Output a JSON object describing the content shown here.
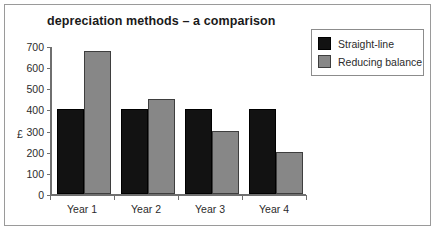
{
  "chart_data": {
    "type": "bar",
    "title": "depreciation methods – a comparison",
    "xlabel": "",
    "ylabel": "£",
    "categories": [
      "Year  1",
      "Year  2",
      "Year  3",
      "Year  4"
    ],
    "series": [
      {
        "name": "Straight-line",
        "color": "#121212",
        "values": [
          400,
          400,
          400,
          400
        ]
      },
      {
        "name": "Reducing balance",
        "color": "#878787",
        "values": [
          675,
          450,
          300,
          200
        ]
      }
    ],
    "ylim": [
      0,
      700
    ],
    "yticks": [
      700,
      600,
      500,
      400,
      300,
      200,
      100,
      0
    ],
    "ytick_labels": [
      "700",
      "600",
      "500",
      "400",
      "300",
      "200",
      "100",
      "0"
    ],
    "grid": false,
    "legend_position": "top-right"
  },
  "legend": {
    "entries": [
      {
        "label": "Straight-line",
        "swatch": "black-swatch"
      },
      {
        "label": "Reducing balance",
        "swatch": "gray-swatch"
      }
    ]
  },
  "colors": {
    "straight_line": "#121212",
    "reducing_balance": "#878787",
    "axis": "#6f6f6f",
    "frame": "#9a9a9a",
    "text": "#2b2b2b",
    "background": "#ffffff"
  }
}
